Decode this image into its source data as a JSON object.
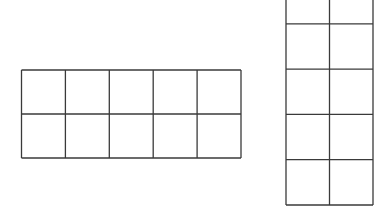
{
  "diagram": {
    "stroke_color": "#3a3a3a",
    "background_color": "#ffffff",
    "grids": [
      {
        "name": "horizontal-grid",
        "columns": 5,
        "rows": 2
      },
      {
        "name": "vertical-grid",
        "columns": 2,
        "rows": 5,
        "top_cropped": true
      }
    ]
  }
}
